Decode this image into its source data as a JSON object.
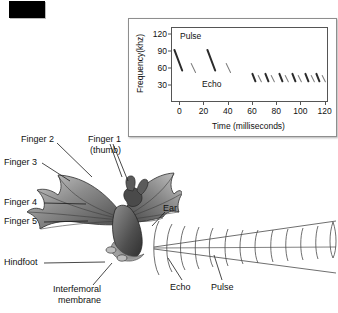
{
  "figure": {
    "title_swatch": "black-color-swatch"
  },
  "chart_data": {
    "type": "scatter",
    "title": "",
    "xlabel": "Time (milliseconds)",
    "ylabel": "Frequency(khz)",
    "xlim": [
      0,
      128
    ],
    "ylim": [
      0,
      130
    ],
    "xticks": [
      0,
      20,
      40,
      60,
      80,
      100,
      120
    ],
    "yticks": [
      30,
      60,
      90,
      120
    ],
    "grid": false,
    "legend": "inline-annotations",
    "annotations": [
      {
        "text": "Pulse",
        "x": 6,
        "y": 122
      },
      {
        "text": "Echo",
        "x": 22,
        "y": 38
      }
    ],
    "series": [
      {
        "name": "Pulse",
        "description": "downward frequency-modulated sweep emitted by the bat",
        "values": [
          {
            "t_start": 2,
            "t_end": 9,
            "f_start": 92,
            "f_end": 52
          },
          {
            "t_start": 29,
            "t_end": 36,
            "f_start": 92,
            "f_end": 52
          },
          {
            "t_start": 66,
            "t_end": 69,
            "f_start": 50,
            "f_end": 34
          },
          {
            "t_start": 77,
            "t_end": 80,
            "f_start": 50,
            "f_end": 34
          },
          {
            "t_start": 88,
            "t_end": 91,
            "f_start": 50,
            "f_end": 34
          },
          {
            "t_start": 99,
            "t_end": 102,
            "f_start": 50,
            "f_end": 34
          },
          {
            "t_start": 110,
            "t_end": 113,
            "f_start": 50,
            "f_end": 34
          },
          {
            "t_start": 119,
            "t_end": 122,
            "f_start": 50,
            "f_end": 34
          }
        ]
      },
      {
        "name": "Echo",
        "description": "returning reflection of each pulse, fainter and slightly delayed",
        "values": [
          {
            "t_start": 16,
            "t_end": 20,
            "f_start": 68,
            "f_end": 50
          },
          {
            "t_start": 45,
            "t_end": 49,
            "f_start": 68,
            "f_end": 50
          },
          {
            "t_start": 71,
            "t_end": 74,
            "f_start": 46,
            "f_end": 33
          },
          {
            "t_start": 82,
            "t_end": 85,
            "f_start": 46,
            "f_end": 33
          },
          {
            "t_start": 93,
            "t_end": 96,
            "f_start": 46,
            "f_end": 33
          },
          {
            "t_start": 104,
            "t_end": 107,
            "f_start": 46,
            "f_end": 33
          },
          {
            "t_start": 115,
            "t_end": 118,
            "f_start": 46,
            "f_end": 33
          },
          {
            "t_start": 124,
            "t_end": 127,
            "f_start": 46,
            "f_end": 33
          }
        ]
      }
    ]
  },
  "labels": {
    "finger2": "Finger 2",
    "finger1": "Finger 1",
    "finger1_sub": "(thumb)",
    "finger3": "Finger 3",
    "finger4": "Finger 4",
    "finger5": "Finger 5",
    "hindfoot": "Hindfoot",
    "interfemoral_1": "Interfemoral",
    "interfemoral_2": "membrane",
    "ear": "Ear",
    "echo": "Echo",
    "pulse": "Pulse"
  },
  "colors": {
    "bat_dark": "#3a3a3a",
    "bat_mid": "#6d6d6d",
    "bat_light": "#a8a8a8",
    "chart_border": "#555555",
    "beam_line": "#4a4a4a",
    "swatch": "#000000"
  }
}
